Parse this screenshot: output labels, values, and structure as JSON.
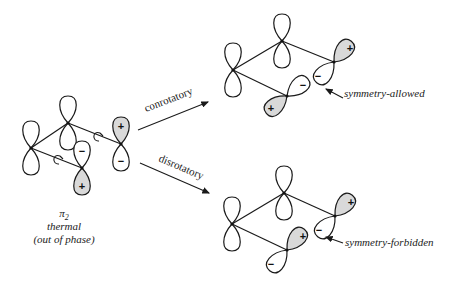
{
  "diagram": {
    "reactant": {
      "orbital_label": "π",
      "orbital_subscript": "2",
      "condition": "thermal",
      "phase_note": "(out of phase)"
    },
    "paths": [
      {
        "name": "conrotatory",
        "label": "conrotatory",
        "result": "symmetry-allowed"
      },
      {
        "name": "disrotatory",
        "label": "disrotatory",
        "result": "symmetry-forbidden"
      }
    ],
    "signs": {
      "plus": "+",
      "minus": "−"
    },
    "colors": {
      "line": "#1a1a1a",
      "shaded_lobe": "#d9d9d9",
      "background": "#ffffff"
    }
  }
}
